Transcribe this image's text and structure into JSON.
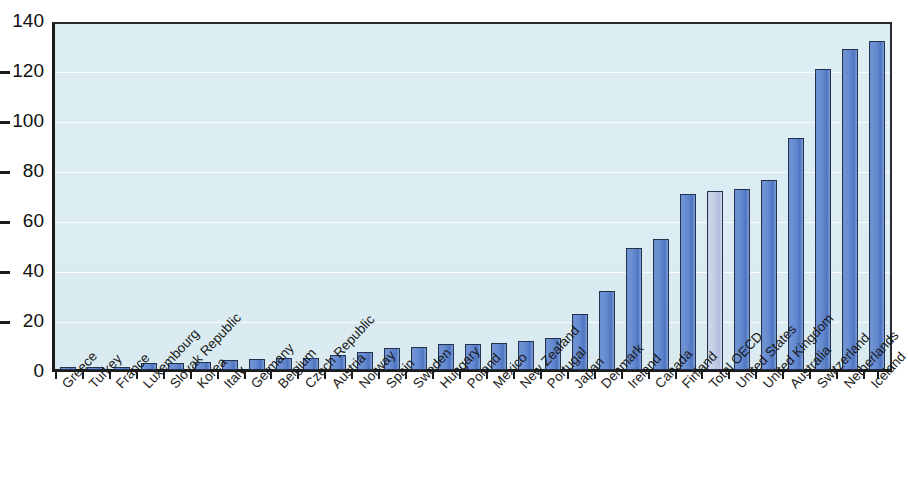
{
  "chart_data": {
    "type": "bar",
    "title": "",
    "subtitle": "",
    "xlabel": "",
    "ylabel": "",
    "ylim": [
      0,
      140
    ],
    "yticks": [
      0,
      20,
      40,
      60,
      80,
      100,
      120,
      140
    ],
    "grid": true,
    "legend": "none",
    "highlight_category": "Total OECD",
    "colors": {
      "bar_fill": "#5f86cd",
      "bar_edge": "#24324e",
      "highlight_fill": "#c3cde6",
      "plot_background": "#dcedf3",
      "gridline": "#ffffff",
      "axis": "#1b1b1b",
      "text": "#1a1a1a"
    },
    "categories": [
      "Greece",
      "Turkey",
      "France",
      "Luxembourg",
      "Slovak Republic",
      "Korea",
      "Italy",
      "Germany",
      "Belgium",
      "Czech Republic",
      "Austria",
      "Norway",
      "Spain",
      "Sweden",
      "Hungary",
      "Poland",
      "Mexico",
      "New Zealand",
      "Portugal",
      "Japan",
      "Denmark",
      "Ireland",
      "Canada",
      "Finland",
      "Total OECD",
      "United States",
      "United Kingdom",
      "Australia",
      "Switzerland",
      "Netherlands",
      "Iceland"
    ],
    "values": [
      0.8,
      1.0,
      1.2,
      2.8,
      3.0,
      3.2,
      4.0,
      4.3,
      4.8,
      5.0,
      6.2,
      7.2,
      9.0,
      9.2,
      10.3,
      10.6,
      10.8,
      11.8,
      13.0,
      22.5,
      31.5,
      49.0,
      52.5,
      70.5,
      71.5,
      72.5,
      76.0,
      93.0,
      120.5,
      128.5,
      131.5
    ]
  }
}
